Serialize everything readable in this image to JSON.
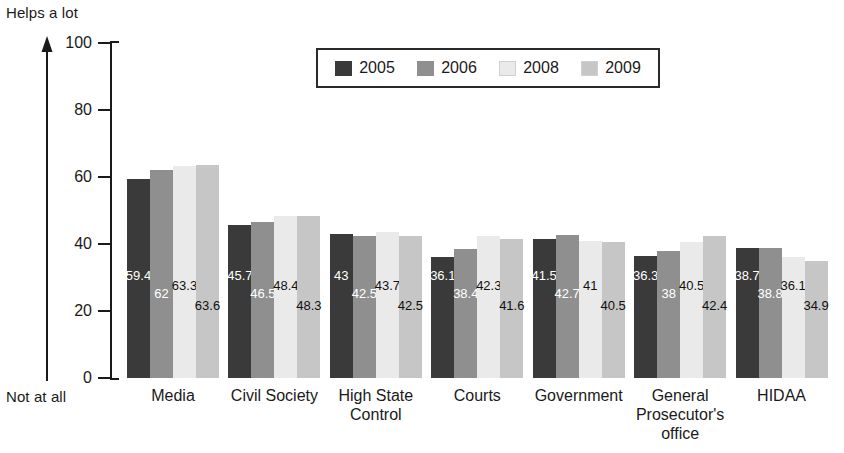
{
  "axis_end_labels": {
    "top": "Helps a lot",
    "bottom": "Not at all"
  },
  "legend": {
    "items": [
      {
        "label": "2005",
        "color": "#3a3a3a"
      },
      {
        "label": "2006",
        "color": "#8f8f8f"
      },
      {
        "label": "2008",
        "color": "#eaeaea"
      },
      {
        "label": "2009",
        "color": "#c6c6c6"
      }
    ]
  },
  "chart_data": {
    "type": "bar",
    "title": "",
    "subtitle": "",
    "xlabel": "",
    "ylabel": "",
    "ylim": [
      0,
      100
    ],
    "yticks": [
      0,
      20,
      40,
      60,
      80,
      100
    ],
    "grid": false,
    "legend_position": "top-center",
    "categories": [
      "Media",
      "Civil Society",
      "High State Control",
      "Courts",
      "Government",
      "General Prosecutor's office",
      "HIDAA"
    ],
    "category_lines": [
      [
        "Media"
      ],
      [
        "Civil Society"
      ],
      [
        "High State",
        "Control"
      ],
      [
        "Courts"
      ],
      [
        "Government"
      ],
      [
        "General",
        "Prosecutor's",
        "office"
      ],
      [
        "HIDAA"
      ]
    ],
    "series": [
      {
        "name": "2005",
        "color": "#3a3a3a",
        "values": [
          59.4,
          45.7,
          43,
          36.1,
          41.5,
          36.3,
          38.7
        ]
      },
      {
        "name": "2006",
        "color": "#8f8f8f",
        "values": [
          62,
          46.5,
          42.5,
          38.4,
          42.7,
          38,
          38.8
        ]
      },
      {
        "name": "2008",
        "color": "#eaeaea",
        "values": [
          63.3,
          48.4,
          43.7,
          42.3,
          41,
          40.5,
          36.1
        ]
      },
      {
        "name": "2009",
        "color": "#c6c6c6",
        "values": [
          63.6,
          48.3,
          42.5,
          41.6,
          40.5,
          42.4,
          34.9
        ]
      }
    ],
    "value_labels": [
      [
        "59.4",
        "62",
        "63.3",
        "63.6"
      ],
      [
        "45.7",
        "46.5",
        "48.4",
        "48.3"
      ],
      [
        "43",
        "42.5",
        "43.7",
        "42.5"
      ],
      [
        "36.1",
        "38.4",
        "42.3",
        "41.6"
      ],
      [
        "41.5",
        "42.7",
        "41",
        "40.5"
      ],
      [
        "36.3",
        "38",
        "40.5",
        "42.4"
      ],
      [
        "38.7",
        "38.8",
        "36.1",
        "34.9"
      ]
    ]
  },
  "layout": {
    "bar_width": 23,
    "group_gap": 14,
    "plot_left": 110,
    "plot_top": 43,
    "plot_height": 335,
    "label_offsets": [
      96,
      78,
      86,
      66
    ]
  }
}
